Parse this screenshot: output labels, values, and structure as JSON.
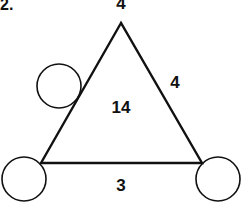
{
  "problem": {
    "number_label": "2.",
    "top_label": "4",
    "center_label": "14",
    "right_side_label": "4",
    "bottom_side_label": "3"
  },
  "shapes": {
    "triangle": {
      "points": "121,23 41,163 202,163",
      "stroke": "#111111",
      "stroke_width": 2.4
    },
    "circles": [
      {
        "name": "circle-upper-left",
        "cx": 59,
        "cy": 86,
        "r": 22
      },
      {
        "name": "circle-bottom-left",
        "cx": 24,
        "cy": 179,
        "r": 22
      },
      {
        "name": "circle-bottom-right",
        "cx": 218,
        "cy": 179,
        "r": 22
      }
    ],
    "circle_stroke": "#111111",
    "circle_stroke_width": 1.6
  },
  "colors": {
    "ink": "#111111",
    "background": "#ffffff"
  }
}
